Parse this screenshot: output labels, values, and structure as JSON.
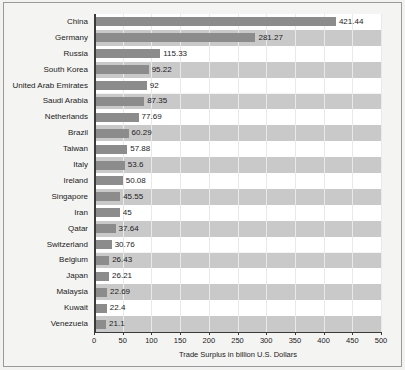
{
  "chart_data": {
    "type": "bar",
    "orientation": "horizontal",
    "title": "",
    "xlabel": "Trade Surplus in billion U.S. Dollars",
    "ylabel": "",
    "xlim": [
      0,
      500
    ],
    "xticks": [
      0,
      50,
      100,
      150,
      200,
      250,
      300,
      350,
      400,
      450,
      500
    ],
    "grid": true,
    "legend": "none",
    "bar_color": "#8c8c8c",
    "band_colors": [
      "#ffffff",
      "#c9c9c9"
    ],
    "categories": [
      "China",
      "Germany",
      "Russia",
      "South Korea",
      "United Arab Emirates",
      "Saudi Arabia",
      "Netherlands",
      "Brazil",
      "Taiwan",
      "Italy",
      "Ireland",
      "Singapore",
      "Iran",
      "Qatar",
      "Switzerland",
      "Belgium",
      "Japan",
      "Malaysia",
      "Kuwait",
      "Venezuela"
    ],
    "values": [
      421.44,
      281.27,
      115.33,
      95.22,
      92,
      87.35,
      77.69,
      60.29,
      57.88,
      53.6,
      50.08,
      45.55,
      45,
      37.64,
      30.76,
      26.43,
      26.21,
      22.69,
      22.4,
      21.1
    ],
    "value_labels": [
      "421.44",
      "281.27",
      "115.33",
      "95.22",
      "92",
      "87.35",
      "77.69",
      "60.29",
      "57.88",
      "53.6",
      "50.08",
      "45.55",
      "45",
      "37.64",
      "30.76",
      "26.43",
      "26.21",
      "22.69",
      "22.4",
      "21.1"
    ],
    "xtick_labels": [
      "0",
      "50",
      "100",
      "150",
      "200",
      "250",
      "300",
      "350",
      "400",
      "450",
      "500"
    ]
  }
}
